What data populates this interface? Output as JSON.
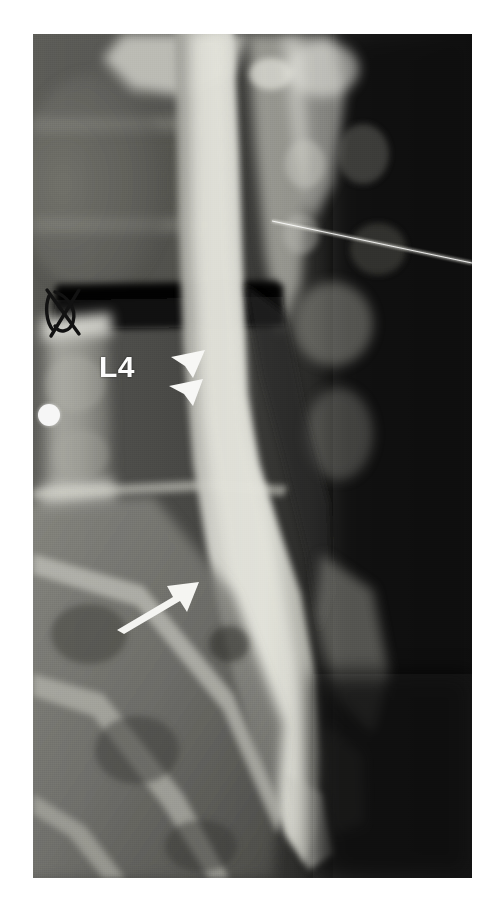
{
  "figure": {
    "modality": "radiograph",
    "view_description": "lateral lumbar spine myelogram",
    "background_color": "#ffffff",
    "plate": {
      "x": 33,
      "y": 34,
      "width": 439,
      "height": 844,
      "base_color": "#0c0c0c",
      "bone_color": "#c9c9c4",
      "soft_tissue_color": "#4a4a48",
      "contrast_column_color": "#d8d8d2",
      "dark_band_color": "#0d0d0d"
    }
  },
  "annotations": {
    "vertebra_label": {
      "text": "L4",
      "x": 99,
      "y": 352,
      "color": "#fdfdfd",
      "font_size_px": 30
    },
    "arrowheads": [
      {
        "name": "upper-arrowhead",
        "tip_x": 171,
        "tip_y": 357,
        "color": "#f7f7f5"
      },
      {
        "name": "lower-arrowhead",
        "tip_x": 169,
        "tip_y": 384,
        "color": "#f7f7f5"
      }
    ],
    "arrow": {
      "name": "solid-arrow",
      "tail_x": 118,
      "tail_y": 623,
      "tip_x": 186,
      "tip_y": 586,
      "color": "#f5f5f2"
    },
    "marker_dot": {
      "name": "radiopaque-skin-marker",
      "center_x": 49,
      "center_y": 415,
      "radius": 11,
      "color": "#f6f6f6"
    },
    "needle_line": {
      "name": "needle-wire",
      "start_x": 272,
      "start_y": 221,
      "end_x": 472,
      "end_y": 263,
      "color": "#efefe8",
      "thickness_px": 2
    },
    "ink_mark": {
      "name": "handwritten-ink-mark",
      "x": 47,
      "y": 292,
      "color": "#151515"
    }
  },
  "anatomy": {
    "structures": [
      {
        "name": "vertebral-body-upper",
        "label": "vertebral body"
      },
      {
        "name": "intervertebral-disc-space",
        "label": "disc space"
      },
      {
        "name": "vertebral-body-l4",
        "label": "L4 vertebral body"
      },
      {
        "name": "contrast-thecal-sac",
        "label": "contrast-filled thecal sac"
      },
      {
        "name": "posterior-elements",
        "label": "posterior elements"
      },
      {
        "name": "sacrum",
        "label": "sacrum"
      },
      {
        "name": "iliac-wing",
        "label": "iliac wing"
      }
    ]
  }
}
